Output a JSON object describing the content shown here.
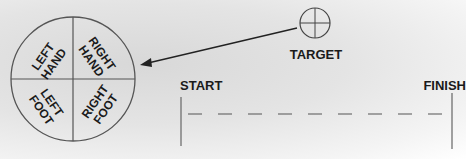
{
  "circle": {
    "quadrants": [
      {
        "id": "left-hand",
        "line1": "LEFT",
        "line2": "HAND"
      },
      {
        "id": "right-hand",
        "line1": "RIGHT",
        "line2": "HAND"
      },
      {
        "id": "left-foot",
        "line1": "LEFT",
        "line2": "FOOT"
      },
      {
        "id": "right-foot",
        "line1": "RIGHT",
        "line2": "FOOT"
      }
    ]
  },
  "target": {
    "label": "TARGET"
  },
  "course": {
    "start_label": "START",
    "finish_label": "FINISH"
  },
  "colors": {
    "ink": "#1a1a1a",
    "line": "#555555"
  }
}
